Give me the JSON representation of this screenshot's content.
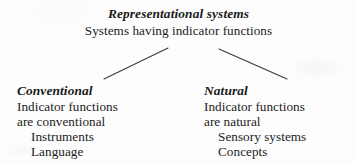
{
  "diagram": {
    "title": "Representational systems",
    "type": "taxonomy-tree",
    "root": {
      "heading": "Representational systems",
      "description": "Systems having indicator functions"
    },
    "branches": [
      {
        "id": "conventional",
        "heading": "Conventional",
        "lines": [
          "Indicator functions",
          "are conventional"
        ],
        "examples": [
          "Instruments",
          "Language"
        ]
      },
      {
        "id": "natural",
        "heading": "Natural",
        "lines": [
          "Indicator functions",
          "are natural"
        ],
        "examples": [
          "Sensory systems",
          "Concepts"
        ]
      }
    ],
    "connectors": {
      "left": {
        "x1": 168,
        "y1": 48,
        "x2": 104,
        "y2": 79
      },
      "right": {
        "x1": 219,
        "y1": 49,
        "x2": 287,
        "y2": 79
      },
      "color": "#3a3a3a",
      "width": 1
    },
    "colors": {
      "background": "#fdfdfd",
      "text": "#1b1b1b",
      "line": "#3a3a3a"
    }
  }
}
